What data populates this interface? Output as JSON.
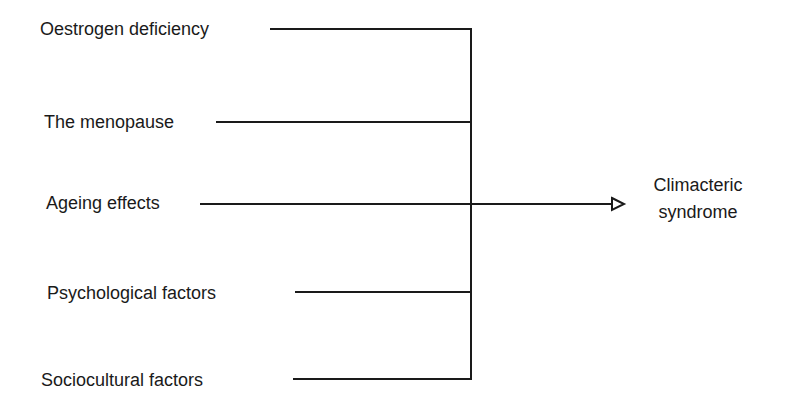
{
  "diagram": {
    "factors": [
      {
        "label": "Oestrogen deficiency"
      },
      {
        "label": "The menopause"
      },
      {
        "label": "Ageing effects"
      },
      {
        "label": "Psychological factors"
      },
      {
        "label": "Sociocultural factors"
      }
    ],
    "outcome": {
      "line1": "Climacteric",
      "line2": "syndrome"
    },
    "line_color": "#1a1a1a"
  }
}
